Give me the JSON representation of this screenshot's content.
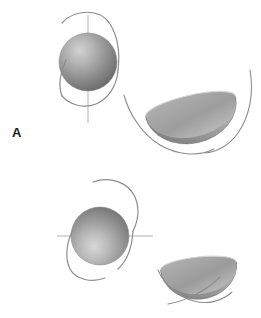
{
  "figure": {
    "background_color": "#ffffff",
    "width": 261,
    "height": 318
  },
  "palette": {
    "background": "#ffffff",
    "sphere_highlight": "#cfcfcf",
    "sphere_mid": "#9a9a9a",
    "sphere_shadow": "#6e6e6e",
    "sphere_edge": "#7d7d7d",
    "bowl_rim_light": "#c9c9c9",
    "bowl_inner_mid": "#a2a2a2",
    "bowl_inner_dark": "#7c7c7c",
    "bowl_outer": "#8d8d8d",
    "curve_stroke": "#8a8a8a",
    "axis_line": "#a0a0a0",
    "label_text": "#1a1a1a"
  },
  "panels": [
    {
      "id": "panel-a",
      "label": "A",
      "label_position": {
        "x": 12,
        "y": 126
      },
      "sphere": {
        "name": "sphere-a",
        "center": {
          "x": 88,
          "y": 62
        },
        "radius": 29,
        "axis_orientation": "vertical",
        "axis_line": {
          "x1": 88,
          "y1": 16,
          "x2": 88,
          "y2": 122
        },
        "shading": "radial gradient, highlight upper-left"
      },
      "orbit_curve": {
        "name": "orbit-curve-a",
        "description": "open elliptical ring passing over top and under bottom of sphere, right lobe in front",
        "stroke_width": 1.1
      },
      "bowl": {
        "name": "bowl-a",
        "rim_center": {
          "x": 190,
          "y": 106
        },
        "rim_rx": 45,
        "rim_ry": 11,
        "rotation_deg": -13,
        "depth": 30,
        "description": "concave hemispherical bowl, opening tilted up-right"
      },
      "bowl_curve": {
        "name": "bowl-curve-a",
        "description": "long sweeping arc passing left-below and right-around the bowl",
        "stroke_width": 1.1
      }
    },
    {
      "id": "panel-b",
      "label": "B",
      "label_position": {
        "x": 12,
        "y": 292
      },
      "sphere": {
        "name": "sphere-b",
        "center": {
          "x": 100,
          "y": 236
        },
        "radius": 29,
        "axis_orientation": "horizontal",
        "axis_line": {
          "x1": 58,
          "y1": 236,
          "x2": 152,
          "y2": 236
        },
        "shading": "radial gradient, highlight lower-left"
      },
      "orbit_curve": {
        "name": "orbit-curve-b",
        "description": "open ring arcing over the top-right and descending around the left-bottom of sphere",
        "stroke_width": 1.1
      },
      "bowl": {
        "name": "bowl-b",
        "rim_center": {
          "x": 198,
          "y": 266
        },
        "rim_rx": 38,
        "rim_ry": 9,
        "rotation_deg": -6,
        "depth": 27,
        "description": "concave hemispherical bowl, opening tilted up-right"
      },
      "bowl_curve": {
        "name": "bowl-curve-b",
        "description": "two crossing arcs sweeping beneath the bowl",
        "stroke_width": 1.1
      }
    }
  ]
}
